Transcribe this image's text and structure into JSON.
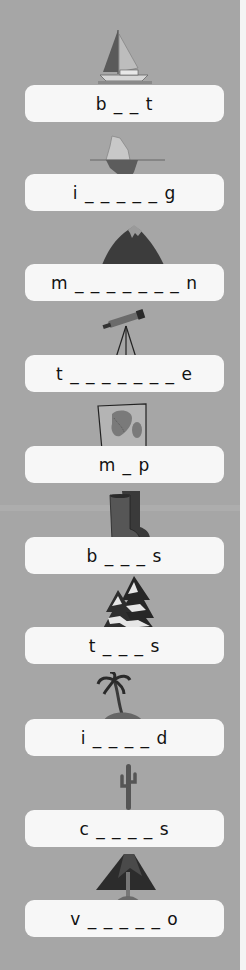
{
  "worksheet": {
    "background_color": "#a6a6a6",
    "card_color": "#f7f7f7",
    "items": [
      {
        "picture": "sailboat-icon",
        "hint": "b _ _ t"
      },
      {
        "picture": "iceberg-icon",
        "hint": "i _ _ _ _ _ g"
      },
      {
        "picture": "mountain-icon",
        "hint": "m _ _ _ _ _ _ _ n"
      },
      {
        "picture": "telescope-icon",
        "hint": "t _ _ _ _ _ _ _ e"
      },
      {
        "picture": "map-icon",
        "hint": "m _ p"
      },
      {
        "picture": "boots-icon",
        "hint": "b _ _ _ s"
      },
      {
        "picture": "snowy-trees-icon",
        "hint": "t _ _ _ s"
      },
      {
        "picture": "island-icon",
        "hint": "i _ _ _ _ d"
      },
      {
        "picture": "cactus-icon",
        "hint": "c _ _ _ _ s"
      },
      {
        "picture": "volcano-icon",
        "hint": "v _ _ _ _ _ o"
      }
    ]
  }
}
